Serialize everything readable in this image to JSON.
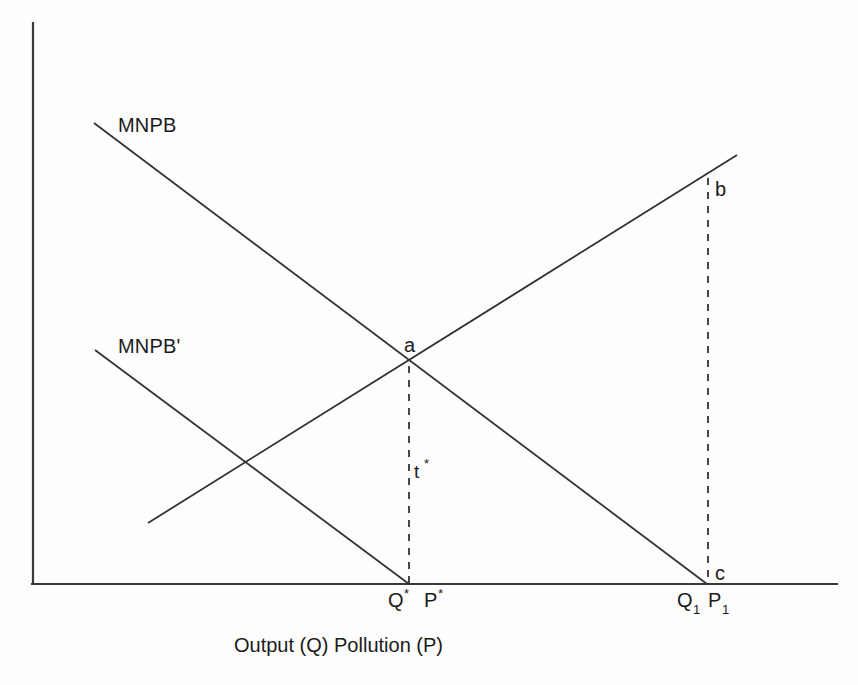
{
  "figure": {
    "background_color": "#fdfdfd",
    "line_color": "#333333",
    "text_color": "#1b1b1b"
  },
  "axes": {
    "x_axis_label": "Output (Q) Pollution (P)",
    "origin": {
      "x": 33,
      "y": 584
    },
    "y_axis_top": {
      "x": 33,
      "y": 23
    },
    "x_axis_right": {
      "x": 837,
      "y": 584
    }
  },
  "curves": [
    {
      "id": "mnpb",
      "label": "MNPB",
      "style": "solid",
      "label_position": {
        "x": 118,
        "y": 132
      },
      "from": {
        "x": 94,
        "y": 123
      },
      "to": {
        "x": 707,
        "y": 584
      }
    },
    {
      "id": "mnpb-prime",
      "label": "MNPB'",
      "style": "solid",
      "label_position": {
        "x": 118,
        "y": 353
      },
      "from": {
        "x": 95,
        "y": 350
      },
      "to": {
        "x": 409,
        "y": 584
      }
    },
    {
      "id": "mec",
      "label": "",
      "style": "solid",
      "label_position": null,
      "from": {
        "x": 148,
        "y": 523
      },
      "to": {
        "x": 737,
        "y": 155
      }
    }
  ],
  "dashed_lines": [
    {
      "id": "a-to-qstar",
      "from": {
        "x": 409,
        "y": 366
      },
      "to": {
        "x": 409,
        "y": 584
      }
    },
    {
      "id": "b-to-c",
      "from": {
        "x": 708,
        "y": 178
      },
      "to": {
        "x": 708,
        "y": 584
      }
    }
  ],
  "points": [
    {
      "id": "a",
      "label": "a",
      "x": 408,
      "y": 363,
      "label_position": {
        "x": 404,
        "y": 352
      }
    },
    {
      "id": "b",
      "label": "b",
      "x": 708,
      "y": 180,
      "label_position": {
        "x": 715,
        "y": 196
      }
    },
    {
      "id": "c",
      "label": "c",
      "x": 707,
      "y": 584,
      "label_position": {
        "x": 715,
        "y": 580
      }
    }
  ],
  "annotations": [
    {
      "id": "tax",
      "label": "t",
      "superscript": "*",
      "x": 414,
      "y": 478
    }
  ],
  "axis_ticks": [
    {
      "id": "q-star",
      "base": "Q",
      "superscript": "*",
      "subscript": "",
      "label_position": {
        "x": 388,
        "y": 607
      }
    },
    {
      "id": "p-star",
      "base": "P",
      "superscript": "*",
      "subscript": "",
      "label_position": {
        "x": 424,
        "y": 607
      }
    },
    {
      "id": "q-one",
      "base": "Q",
      "superscript": "",
      "subscript": "1",
      "label_position": {
        "x": 677,
        "y": 607
      }
    },
    {
      "id": "p-one",
      "base": "P",
      "superscript": "",
      "subscript": "1",
      "label_position": {
        "x": 714,
        "y": 607
      }
    }
  ],
  "axis_title": {
    "text": "Output (Q) Pollution (P)",
    "position": {
      "x": 234,
      "y": 652
    }
  },
  "ghost_caption": {
    "text": ""
  }
}
